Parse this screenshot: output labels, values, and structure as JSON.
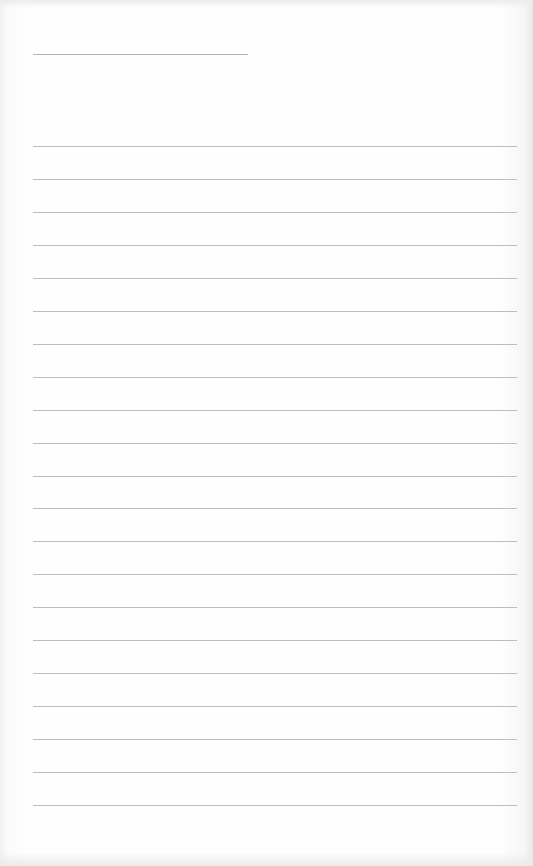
{
  "page": {
    "type": "blank lined paper",
    "title_line": {
      "x": 33,
      "y": 54,
      "width": 215
    },
    "rules": {
      "count": 21,
      "first_y": 146,
      "spacing": 32.95,
      "x": 33,
      "width": 484
    },
    "colors": {
      "paper": "#fdfdfd",
      "rule": "#bdbdbd"
    }
  }
}
